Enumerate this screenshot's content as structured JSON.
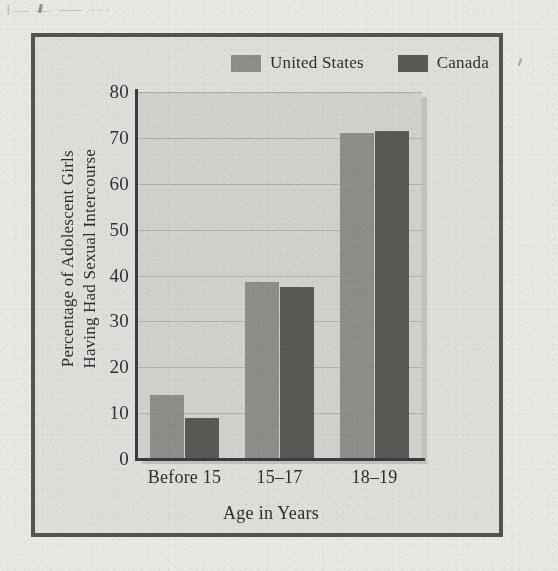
{
  "figure": {
    "bleed_through_text": "Ɨ—  ―   ⸺ ···",
    "border_color": "#565450",
    "paper_color": "#e9e8e4",
    "panel_color": "#dfdeda",
    "plot_bg_color": "#d2d1cd"
  },
  "legend": {
    "position": "top-right",
    "entries": [
      {
        "label": "United States",
        "color": "#8f8d89",
        "swatch_name": "legend-swatch-united-states"
      },
      {
        "label": "Canada",
        "color": "#5b5956",
        "swatch_name": "legend-swatch-canada"
      }
    ]
  },
  "chart_data": {
    "type": "bar",
    "title": "",
    "subtitle": "",
    "xlabel": "Age in Years",
    "ylabel": "Percentage of Adolescent Girls Having Had Sexual Intercourse",
    "ylabel_line1": "Percentage of Adolescent Girls",
    "ylabel_line2": "Having Had Sexual Intercourse",
    "categories": [
      "Before 15",
      "15–17",
      "18–19"
    ],
    "series": [
      {
        "name": "United States",
        "color": "#8f8d89",
        "values": [
          14,
          38.5,
          71
        ]
      },
      {
        "name": "Canada",
        "color": "#5b5956",
        "values": [
          9,
          37.5,
          71.5
        ]
      }
    ],
    "ylim": [
      0,
      80
    ],
    "yticks": [
      0,
      10,
      20,
      30,
      40,
      50,
      60,
      70,
      80
    ],
    "ytick_labels": [
      "0",
      "10",
      "20",
      "30",
      "40",
      "50",
      "60",
      "70",
      "80"
    ],
    "grid": true,
    "grid_axis": "y",
    "legend_position": "top-right",
    "bar_group_order": [
      "United States",
      "Canada"
    ]
  }
}
